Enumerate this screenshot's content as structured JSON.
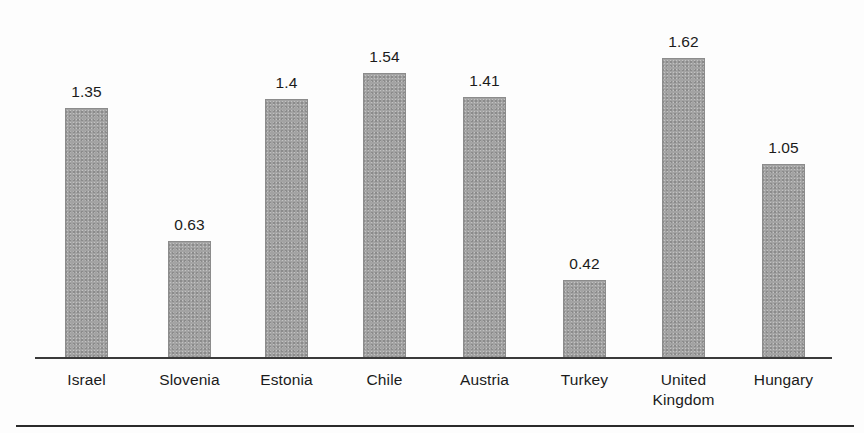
{
  "chart_data": {
    "type": "bar",
    "title": "",
    "subtitle": "",
    "xlabel": "",
    "ylabel": "",
    "ylim": [
      0,
      1.62
    ],
    "grid": false,
    "legend": "none",
    "axis_visible": {
      "x": true,
      "y": false
    },
    "value_labels_shown": true,
    "categories": [
      "Israel",
      "Slovenia",
      "Estonia",
      "Chile",
      "Austria",
      "Turkey",
      "United\nKingdom",
      "Hungary"
    ],
    "values": [
      1.35,
      0.63,
      1.4,
      1.54,
      1.41,
      0.42,
      1.62,
      1.05
    ],
    "value_labels": [
      "1.35",
      "0.63",
      "1.4",
      "1.54",
      "1.41",
      "0.42",
      "1.62",
      "1.05"
    ],
    "bar_color": "#a3a3a3",
    "bar_border_color": "#8c8c8c",
    "axis_color": "#3a3a3a",
    "text_color": "#1b1b1b"
  },
  "geometry": {
    "baseline_y": 358,
    "px_per_unit": 185,
    "bar_width": 43,
    "bar_left_positions": [
      65,
      168,
      265,
      363,
      463,
      563,
      662,
      762
    ]
  }
}
